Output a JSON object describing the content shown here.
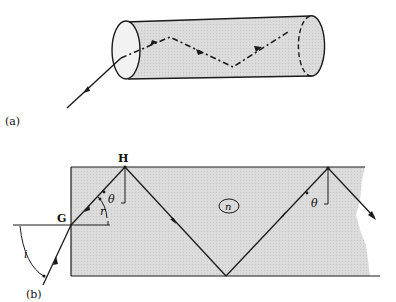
{
  "figure": {
    "panel_a": {
      "label": "(a)",
      "description": "Light ray entering an optical fiber cylinder and zig-zagging by total internal reflection"
    },
    "panel_b": {
      "label": "(b)",
      "point_G": "G",
      "point_H": "H",
      "angle_i": "i",
      "angle_r": "r",
      "angle_theta": "θ",
      "angle_theta_right": "θ",
      "medium_index": "n"
    }
  },
  "colors": {
    "fill": "#d9d9d9",
    "stroke": "#1a1a1a",
    "face_fill": "#efefef"
  }
}
